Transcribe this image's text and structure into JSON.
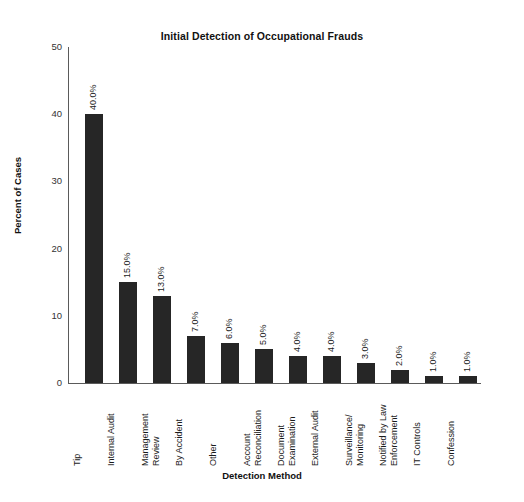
{
  "chart_data": {
    "type": "bar",
    "title": "Initial Detection of Occupational Frauds",
    "xlabel": "Detection Method",
    "ylabel": "Percent of Cases",
    "ylim": [
      0,
      50
    ],
    "yticks": [
      0,
      10,
      20,
      30,
      40,
      50
    ],
    "grid": false,
    "legend": "none",
    "orientation": "vertical",
    "bar_color": "#262626",
    "categories": [
      "Tip",
      "Internal Audit",
      "Management Review",
      "By Accident",
      "Other",
      "Account Reconciliation",
      "Document Examination",
      "External Audit",
      "Surveillance/ Monitoring",
      "Notified by Law Enforcement",
      "IT Controls",
      "Confession"
    ],
    "category_lines": [
      [
        "Tip"
      ],
      [
        "Internal Audit"
      ],
      [
        "Management",
        "Review"
      ],
      [
        "By Accident"
      ],
      [
        "Other"
      ],
      [
        "Account",
        "Reconciliation"
      ],
      [
        "Document",
        "Examination"
      ],
      [
        "External Audit"
      ],
      [
        "Surveillance/",
        "Monitoring"
      ],
      [
        "Notified by Law",
        "Enforcement"
      ],
      [
        "IT Controls"
      ],
      [
        "Confession"
      ]
    ],
    "values": [
      40.0,
      15.0,
      13.0,
      7.0,
      6.0,
      5.0,
      4.0,
      4.0,
      3.0,
      2.0,
      1.0,
      1.0
    ],
    "value_labels": [
      "40.0%",
      "15.0%",
      "13.0%",
      "7.0%",
      "6.0%",
      "5.0%",
      "4.0%",
      "4.0%",
      "3.0%",
      "2.0%",
      "1.0%",
      "1.0%"
    ],
    "ytick_labels": [
      "0",
      "10",
      "20",
      "30",
      "40",
      "50"
    ]
  }
}
